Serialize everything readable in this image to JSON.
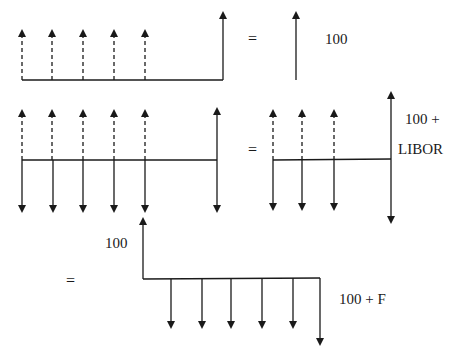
{
  "diagram": {
    "row1": {
      "equals": "=",
      "principal_label": "100"
    },
    "row2": {
      "equals": "=",
      "final_label_line1": "100 +",
      "final_label_line2": "LIBOR"
    },
    "row3": {
      "equals": "=",
      "start_label": "100",
      "final_label": "100 + F"
    },
    "colors": {
      "line": "#1a1a1a",
      "background": "#ffffff"
    }
  }
}
